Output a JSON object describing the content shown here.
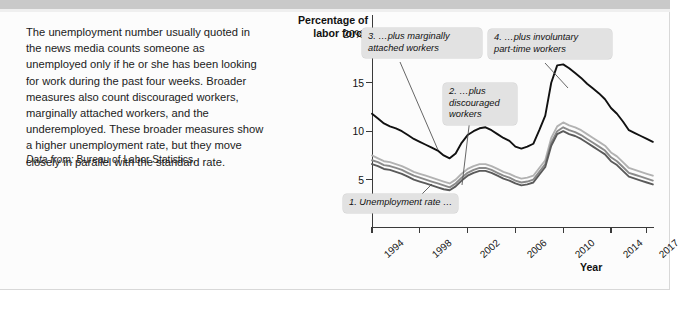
{
  "caption": {
    "body": "The unemployment number usually quoted in the news media counts someone as unemployed only if he or she has been looking for work during the past four weeks. Broader measures also count discouraged workers, marginally attached workers, and the underemployed. These broader measures show a higher unemployment rate, but they move closely in parallel with the standard rate.",
    "source_prefix": "Data from:",
    "source_text": " Bureau of Labor Statistics."
  },
  "callouts": [
    {
      "id": "callout-1",
      "text": "1. Unemployment rate …"
    },
    {
      "id": "callout-2",
      "text": "2. …plus\ndiscouraged\nworkers"
    },
    {
      "id": "callout-3",
      "text": "3. …plus marginally\nattached workers"
    },
    {
      "id": "callout-4",
      "text": "4. …plus involuntary\npart-time workers"
    }
  ],
  "chart_data": {
    "type": "line",
    "title": "",
    "ylabel": "Percentage of\nlabor force",
    "xlabel": "Year",
    "ylim": [
      0,
      22
    ],
    "xlim": [
      1994,
      2017.6
    ],
    "grid": false,
    "legend": "none",
    "ytick_labels": [
      "20%",
      "15",
      "10",
      "5"
    ],
    "ytick_values": [
      20,
      15,
      10,
      5
    ],
    "xtick_labels": [
      "1994",
      "1998",
      "2002",
      "2006",
      "2010",
      "2014",
      "2017"
    ],
    "xtick_values": [
      1994,
      1998,
      2002,
      2006,
      2010,
      2014,
      2017
    ],
    "x": [
      1994,
      1994.5,
      1995,
      1995.5,
      1996,
      1996.5,
      1997,
      1997.5,
      1998,
      1998.5,
      1999,
      1999.5,
      2000,
      2000.5,
      2001,
      2001.5,
      2002,
      2002.5,
      2003,
      2003.5,
      2004,
      2004.5,
      2005,
      2005.5,
      2006,
      2006.5,
      2007,
      2007.5,
      2008,
      2008.5,
      2009,
      2009.5,
      2010,
      2010.5,
      2011,
      2011.5,
      2012,
      2012.5,
      2013,
      2013.5,
      2014,
      2014.5,
      2015,
      2015.5,
      2016,
      2016.5,
      2017,
      2017.5
    ],
    "series": [
      {
        "name": "4. …plus involuntary part-time workers (U-6)",
        "color": "#111111",
        "values": [
          11.8,
          11.3,
          10.8,
          10.5,
          10.3,
          10.0,
          9.6,
          9.2,
          8.9,
          8.6,
          8.3,
          8.0,
          7.5,
          7.2,
          7.7,
          8.8,
          9.6,
          10.0,
          10.3,
          10.4,
          10.1,
          9.7,
          9.3,
          9.0,
          8.4,
          8.2,
          8.4,
          8.7,
          10.1,
          11.6,
          15.0,
          16.8,
          16.9,
          16.5,
          16.0,
          15.5,
          14.9,
          14.4,
          13.9,
          13.3,
          12.4,
          11.8,
          11.0,
          10.1,
          9.8,
          9.5,
          9.2,
          8.9
        ]
      },
      {
        "name": "3. …plus marginally attached workers (U-5)",
        "color": "#b2b2b2",
        "values": [
          7.5,
          7.2,
          6.9,
          6.8,
          6.6,
          6.4,
          6.1,
          5.8,
          5.6,
          5.4,
          5.2,
          5.0,
          4.8,
          4.6,
          5.0,
          5.6,
          6.1,
          6.4,
          6.6,
          6.6,
          6.4,
          6.1,
          5.8,
          5.6,
          5.3,
          5.1,
          5.2,
          5.4,
          6.2,
          7.0,
          9.3,
          10.5,
          10.9,
          10.6,
          10.4,
          10.1,
          9.7,
          9.3,
          8.9,
          8.5,
          7.8,
          7.4,
          6.8,
          6.2,
          6.0,
          5.8,
          5.6,
          5.4
        ]
      },
      {
        "name": "2. …plus discouraged workers (U-4)",
        "color": "#8a8a8a",
        "values": [
          7.0,
          6.8,
          6.5,
          6.4,
          6.2,
          6.0,
          5.7,
          5.4,
          5.2,
          5.0,
          4.8,
          4.6,
          4.4,
          4.2,
          4.6,
          5.2,
          5.7,
          6.0,
          6.2,
          6.2,
          6.0,
          5.7,
          5.4,
          5.2,
          4.9,
          4.7,
          4.8,
          5.0,
          5.8,
          6.6,
          8.8,
          10.0,
          10.4,
          10.1,
          9.9,
          9.6,
          9.2,
          8.8,
          8.4,
          8.0,
          7.3,
          6.9,
          6.3,
          5.7,
          5.5,
          5.3,
          5.1,
          4.9
        ]
      },
      {
        "name": "1. Unemployment rate (U-3)",
        "color": "#5a5a5a",
        "values": [
          6.6,
          6.4,
          6.1,
          6.0,
          5.8,
          5.6,
          5.3,
          5.0,
          4.8,
          4.6,
          4.4,
          4.2,
          4.0,
          3.9,
          4.3,
          4.9,
          5.4,
          5.7,
          5.9,
          5.9,
          5.7,
          5.4,
          5.1,
          4.9,
          4.6,
          4.4,
          4.5,
          4.7,
          5.5,
          6.3,
          8.5,
          9.7,
          10.0,
          9.7,
          9.5,
          9.2,
          8.8,
          8.4,
          8.0,
          7.6,
          6.9,
          6.5,
          5.9,
          5.3,
          5.1,
          4.9,
          4.7,
          4.5
        ]
      }
    ]
  }
}
